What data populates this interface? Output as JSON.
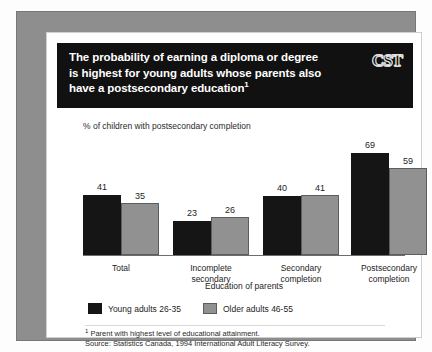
{
  "banner": {
    "title_line1": "The probability of earning a diploma or degree",
    "title_line2": "is highest for young adults whose parents also",
    "title_line3": "have a postsecondary education",
    "title_footnote_marker": "1",
    "logo_text": "CST"
  },
  "footnotes": {
    "marker": "1",
    "line1": " Parent with highest level of educational attainment.",
    "line2": "Source: Statistics Canada, 1994 International Adult Literacy Survey."
  },
  "chart_data": {
    "type": "bar",
    "title": "The probability of earning a diploma or degree is highest for young adults whose parents also have a postsecondary education",
    "subtitle": "% of children with postsecondary completion",
    "xlabel": "Education of parents",
    "ylabel": "% of children with postsecondary completion",
    "ylim": [
      0,
      80
    ],
    "grid": false,
    "legend_position": "bottom-left",
    "categories": [
      "Total",
      "Incomplete secondary",
      "Secondary completion",
      "Postsecondary completion"
    ],
    "category_lines": [
      [
        "Total"
      ],
      [
        "Incomplete",
        "secondary"
      ],
      [
        "Secondary",
        "completion"
      ],
      [
        "Postsecondary",
        "completion"
      ]
    ],
    "series": [
      {
        "name": "Young adults 26-35",
        "color": "#151515",
        "values": [
          41,
          23,
          40,
          69
        ]
      },
      {
        "name": "Older adults 46-55",
        "color": "#919191",
        "values": [
          35,
          26,
          41,
          59
        ]
      }
    ]
  }
}
